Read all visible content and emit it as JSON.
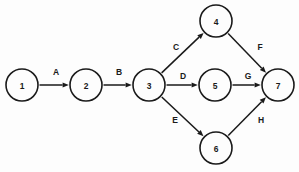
{
  "diagram": {
    "type": "directed-graph",
    "title": "",
    "background_color": "#fdfdfd",
    "stroke_color": "#1a1a1a",
    "node_radius": 16,
    "nodes": [
      {
        "id": "1",
        "label": "1",
        "x": 22,
        "y": 85
      },
      {
        "id": "2",
        "label": "2",
        "x": 86,
        "y": 85
      },
      {
        "id": "3",
        "label": "3",
        "x": 149,
        "y": 85
      },
      {
        "id": "4",
        "label": "4",
        "x": 216,
        "y": 21
      },
      {
        "id": "5",
        "label": "5",
        "x": 215,
        "y": 85
      },
      {
        "id": "6",
        "label": "6",
        "x": 216,
        "y": 148
      },
      {
        "id": "7",
        "label": "7",
        "x": 278,
        "y": 85
      }
    ],
    "edges": [
      {
        "id": "A",
        "label": "A",
        "from": "1",
        "to": "2",
        "label_x": 56,
        "label_y": 72
      },
      {
        "id": "B",
        "label": "B",
        "from": "2",
        "to": "3",
        "label_x": 119,
        "label_y": 72
      },
      {
        "id": "C",
        "label": "C",
        "from": "3",
        "to": "4",
        "label_x": 176,
        "label_y": 47
      },
      {
        "id": "D",
        "label": "D",
        "from": "3",
        "to": "5",
        "label_x": 183,
        "label_y": 76
      },
      {
        "id": "E",
        "label": "E",
        "from": "3",
        "to": "6",
        "label_x": 175,
        "label_y": 120
      },
      {
        "id": "F",
        "label": "F",
        "from": "4",
        "to": "7",
        "label_x": 260,
        "label_y": 47
      },
      {
        "id": "G",
        "label": "G",
        "from": "5",
        "to": "7",
        "label_x": 248,
        "label_y": 76
      },
      {
        "id": "H",
        "label": "H",
        "from": "6",
        "to": "7",
        "label_x": 261,
        "label_y": 120
      }
    ]
  }
}
